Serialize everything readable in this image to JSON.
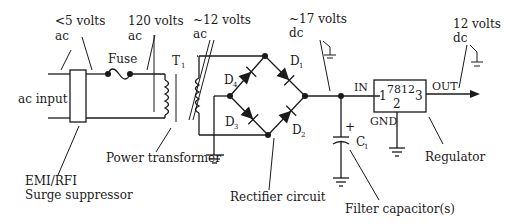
{
  "diagram": {
    "type": "power-supply-block-schematic",
    "labels": {
      "lt5v_line1": "<5 volts",
      "lt5v_line2": "ac",
      "v120_line1": "120 volts",
      "v120_line2": "ac",
      "v12ac_line1": "~12 volts",
      "v12ac_line2": "ac",
      "v17dc_line1": "~17 volts",
      "v17dc_line2": "dc",
      "v12dc_line1": "12 volts",
      "v12dc_line2": "dc",
      "fuse": "Fuse",
      "ac_input": "ac input",
      "transformer_ref": "T",
      "transformer_ref_sub": "1",
      "power_transformer": "Power transformer",
      "emi_line1": "EMI/RFI",
      "emi_line2": "Surge suppressor",
      "rectifier_circuit": "Rectifier circuit",
      "filter_capacitor": "Filter capacitor(s)",
      "regulator": "Regulator",
      "cap_ref": "C",
      "cap_ref_sub": "1",
      "cap_plus": "+",
      "reg_in": "IN",
      "reg_out": "OUT",
      "reg_gnd": "GND",
      "reg_part": "7812",
      "reg_pin1": "1",
      "reg_pin2": "2",
      "reg_pin3": "3"
    },
    "diodes": [
      {
        "ref": "D",
        "sub": "1"
      },
      {
        "ref": "D",
        "sub": "2"
      },
      {
        "ref": "D",
        "sub": "3"
      },
      {
        "ref": "D",
        "sub": "4"
      }
    ],
    "colors": {
      "ink": "#1a1a1a",
      "background": "#ffffff"
    }
  }
}
